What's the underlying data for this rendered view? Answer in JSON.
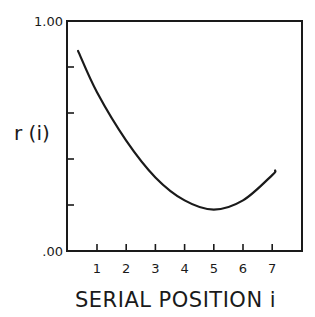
{
  "chart_data": {
    "type": "line",
    "title": "",
    "xlabel": "SERIAL POSITION i",
    "ylabel": "r (i)",
    "x_ticks": [
      "1",
      "2",
      "3",
      "4",
      "5",
      "6",
      "7"
    ],
    "y_tick_labels": {
      "top": "1.00",
      "bottom": ".00"
    },
    "y_ticks": [
      0.0,
      0.2,
      0.4,
      0.6,
      0.8,
      1.0
    ],
    "xlim": [
      0,
      8
    ],
    "ylim": [
      0,
      1
    ],
    "grid": false,
    "legend": null,
    "series": [
      {
        "name": "r(i)",
        "x": [
          0.35,
          1,
          2,
          3,
          4,
          5,
          6,
          7,
          7.1
        ],
        "values": [
          0.87,
          0.69,
          0.48,
          0.32,
          0.22,
          0.18,
          0.22,
          0.33,
          0.35
        ]
      }
    ]
  },
  "labels": {
    "y_top": "1.00",
    "y_bottom": ".00",
    "y_axis": "r (i)",
    "x_axis": "SERIAL POSITION i"
  }
}
